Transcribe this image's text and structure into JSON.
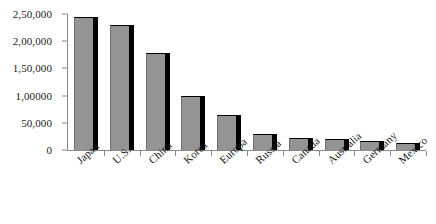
{
  "chart_data": {
    "type": "bar",
    "title": "",
    "subtitle": "",
    "xlabel": "",
    "ylabel": "",
    "categories": [
      "Japan",
      "U.S.",
      "China",
      "Korea",
      "Europa",
      "Russia",
      "Canada",
      "Australia",
      "Germany",
      "Mexico"
    ],
    "values": [
      245000,
      230000,
      178000,
      100000,
      65000,
      30000,
      22000,
      21000,
      16000,
      12000
    ],
    "ylim": [
      0,
      250000
    ],
    "ytick_values": [
      0,
      50000,
      100000,
      150000,
      200000,
      250000
    ],
    "ytick_labels": [
      "0",
      "50,000",
      "1,00000",
      "1,50,000",
      "2,00,000",
      "2,50,000"
    ],
    "grid": false,
    "legend": null,
    "legend_position": "none",
    "bar_style": "3d-shadow",
    "colors": {
      "bar_fill": "#949494",
      "bar_shadow": "#000000",
      "axis": "#8a8a8a",
      "text": "#1a1a1a",
      "background": "#ffffff"
    }
  }
}
